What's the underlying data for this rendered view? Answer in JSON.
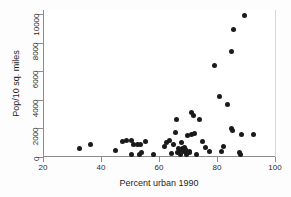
{
  "chart_data": {
    "type": "scatter",
    "title": "",
    "xlabel": "Percent urban 1990",
    "ylabel": "Pop/10 sq. miles",
    "xlim": [
      20,
      100
    ],
    "ylim": [
      0,
      10000
    ],
    "xticks": [
      20,
      40,
      60,
      80,
      100
    ],
    "yticks": [
      0,
      2000,
      4000,
      6000,
      8000,
      10000
    ],
    "xtick_labels": [
      "20",
      "40",
      "60",
      "80",
      "100"
    ],
    "ytick_labels": [
      "0",
      "2000",
      "4000",
      "6000",
      "8000",
      "10000"
    ],
    "grid": false,
    "legend": null,
    "marker": {
      "shape": "circle",
      "color": "#1a1a1a",
      "size": 5
    },
    "points": [
      {
        "x": 32.3,
        "y": 620
      },
      {
        "x": 36.2,
        "y": 870
      },
      {
        "x": 44.5,
        "y": 430
      },
      {
        "x": 47.2,
        "y": 1080
      },
      {
        "x": 48.6,
        "y": 1180
      },
      {
        "x": 50.0,
        "y": 1180
      },
      {
        "x": 50.3,
        "y": 150
      },
      {
        "x": 51.0,
        "y": 870
      },
      {
        "x": 52.4,
        "y": 900
      },
      {
        "x": 52.8,
        "y": 160
      },
      {
        "x": 53.3,
        "y": 900
      },
      {
        "x": 53.6,
        "y": 330
      },
      {
        "x": 55.0,
        "y": 1100
      },
      {
        "x": 57.7,
        "y": 150
      },
      {
        "x": 61.7,
        "y": 700
      },
      {
        "x": 62.4,
        "y": 980
      },
      {
        "x": 63.3,
        "y": 1180
      },
      {
        "x": 64.0,
        "y": 260
      },
      {
        "x": 64.6,
        "y": 900
      },
      {
        "x": 65.2,
        "y": 1720
      },
      {
        "x": 65.6,
        "y": 2620
      },
      {
        "x": 66.0,
        "y": 320
      },
      {
        "x": 66.3,
        "y": 620
      },
      {
        "x": 66.6,
        "y": 430
      },
      {
        "x": 67.1,
        "y": 180
      },
      {
        "x": 67.4,
        "y": 980
      },
      {
        "x": 67.8,
        "y": 560
      },
      {
        "x": 68.1,
        "y": 390
      },
      {
        "x": 68.4,
        "y": 640
      },
      {
        "x": 68.7,
        "y": 490
      },
      {
        "x": 69.0,
        "y": 320
      },
      {
        "x": 69.3,
        "y": 200
      },
      {
        "x": 69.6,
        "y": 1480
      },
      {
        "x": 70.0,
        "y": 390
      },
      {
        "x": 70.3,
        "y": 280
      },
      {
        "x": 70.7,
        "y": 3080
      },
      {
        "x": 71.0,
        "y": 1570
      },
      {
        "x": 71.4,
        "y": 2900
      },
      {
        "x": 71.8,
        "y": 1620
      },
      {
        "x": 72.5,
        "y": 170
      },
      {
        "x": 73.5,
        "y": 2620
      },
      {
        "x": 74.6,
        "y": 1080
      },
      {
        "x": 75.8,
        "y": 650
      },
      {
        "x": 77.0,
        "y": 360
      },
      {
        "x": 78.8,
        "y": 6400
      },
      {
        "x": 80.5,
        "y": 4250
      },
      {
        "x": 81.3,
        "y": 370
      },
      {
        "x": 82.0,
        "y": 700
      },
      {
        "x": 83.2,
        "y": 3700
      },
      {
        "x": 84.5,
        "y": 7350
      },
      {
        "x": 84.7,
        "y": 1980
      },
      {
        "x": 84.9,
        "y": 1820
      },
      {
        "x": 85.3,
        "y": 8900
      },
      {
        "x": 87.3,
        "y": 330
      },
      {
        "x": 87.7,
        "y": 180
      },
      {
        "x": 88.2,
        "y": 1560
      },
      {
        "x": 89.2,
        "y": 9900
      },
      {
        "x": 92.3,
        "y": 1560
      }
    ]
  }
}
